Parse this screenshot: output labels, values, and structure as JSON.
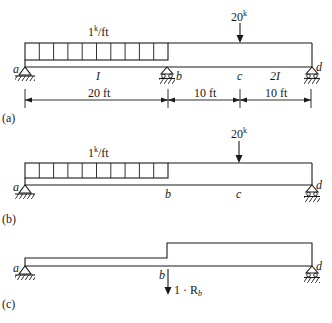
{
  "figure": {
    "panels": [
      {
        "id": "a",
        "panel_label": "(a)",
        "distributed_load": "1",
        "distributed_load_sup": "k",
        "distributed_load_unit": "/ft",
        "point_load": "20",
        "point_load_sup": "k",
        "nodes": {
          "a": "a",
          "b": "b",
          "c": "c",
          "d": "d"
        },
        "stiffness_left": "I",
        "stiffness_right": "2I",
        "dimensions": [
          "20 ft",
          "10 ft",
          "10 ft"
        ]
      },
      {
        "id": "b",
        "panel_label": "(b)",
        "distributed_load": "1",
        "distributed_load_sup": "k",
        "distributed_load_unit": "/ft",
        "point_load": "20",
        "point_load_sup": "k",
        "nodes": {
          "a": "a",
          "b": "b",
          "c": "c",
          "d": "d"
        }
      },
      {
        "id": "c",
        "panel_label": "(c)",
        "nodes": {
          "a": "a",
          "b": "b",
          "d": "d"
        },
        "redundant_load": "1 · R",
        "redundant_load_sub": "b"
      }
    ],
    "colors": {
      "ink": "#1a1a1a",
      "background": "#ffffff"
    }
  }
}
